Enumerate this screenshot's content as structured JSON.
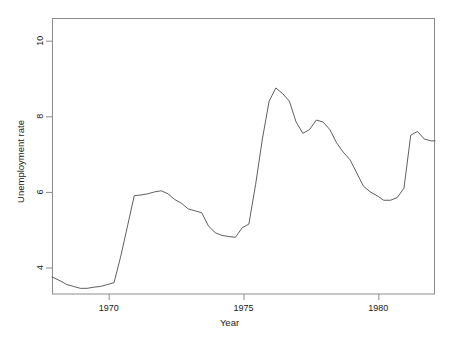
{
  "chart_data": {
    "type": "line",
    "title": "",
    "xlabel": "Year",
    "ylabel": "Unemployment rate",
    "xlim": [
      1967.9,
      1982.1
    ],
    "ylim": [
      3.3,
      10.6
    ],
    "xticks": [
      1970,
      1975,
      1980
    ],
    "xtick_labels": [
      "1970",
      "1975",
      "1980"
    ],
    "yticks": [
      4,
      6,
      8,
      10
    ],
    "ytick_labels": [
      "4",
      "6",
      "8",
      "10"
    ],
    "grid": false,
    "legend": "none",
    "line_color": "#4d4d4d",
    "series": [
      {
        "name": "Unemployment rate",
        "x": [
          1967.9,
          1968.2,
          1968.45,
          1968.7,
          1968.95,
          1969.2,
          1969.45,
          1969.7,
          1969.95,
          1970.2,
          1970.45,
          1970.7,
          1970.95,
          1971.2,
          1971.45,
          1971.7,
          1971.95,
          1972.2,
          1972.45,
          1972.7,
          1972.95,
          1973.2,
          1973.45,
          1973.7,
          1973.95,
          1974.2,
          1974.45,
          1974.7,
          1974.95,
          1975.2,
          1975.45,
          1975.7,
          1975.95,
          1976.2,
          1976.45,
          1976.7,
          1976.95,
          1977.2,
          1977.45,
          1977.7,
          1977.95,
          1978.2,
          1978.45,
          1978.7,
          1978.95,
          1979.2,
          1979.45,
          1979.7,
          1979.95,
          1980.2,
          1980.45,
          1980.7,
          1980.95,
          1981.2,
          1981.45,
          1981.7,
          1981.95,
          1982.1
        ],
        "values": [
          3.75,
          3.65,
          3.55,
          3.5,
          3.45,
          3.45,
          3.48,
          3.5,
          3.55,
          3.6,
          4.3,
          5.1,
          5.9,
          5.92,
          5.95,
          6.0,
          6.03,
          5.95,
          5.8,
          5.7,
          5.55,
          5.5,
          5.45,
          5.1,
          4.92,
          4.85,
          4.82,
          4.8,
          5.05,
          5.15,
          6.2,
          7.4,
          8.4,
          8.75,
          8.6,
          8.4,
          7.85,
          7.55,
          7.65,
          7.9,
          7.85,
          7.65,
          7.3,
          7.05,
          6.85,
          6.5,
          6.15,
          6.0,
          5.9,
          5.78,
          5.78,
          5.85,
          6.1,
          7.5,
          7.6,
          7.4,
          7.35,
          7.35
        ]
      }
    ],
    "annotations": []
  },
  "plot_box": {
    "left": 52,
    "right": 435,
    "top": 18,
    "bottom": 294,
    "border_color": "#808080"
  }
}
